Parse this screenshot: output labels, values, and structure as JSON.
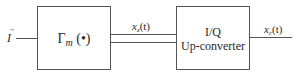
{
  "diagram": {
    "input": {
      "label": "I",
      "accent": "→"
    },
    "block1": {
      "symbol": "Γ",
      "subscript": "m",
      "argument": "(•)"
    },
    "signal_between": {
      "base": "x",
      "subscript": "z",
      "arg": "(t)"
    },
    "block2": {
      "line1": "I/Q",
      "line2": "Up-converter"
    },
    "output": {
      "base": "x",
      "subscript": "c",
      "arg": "(t)"
    }
  }
}
